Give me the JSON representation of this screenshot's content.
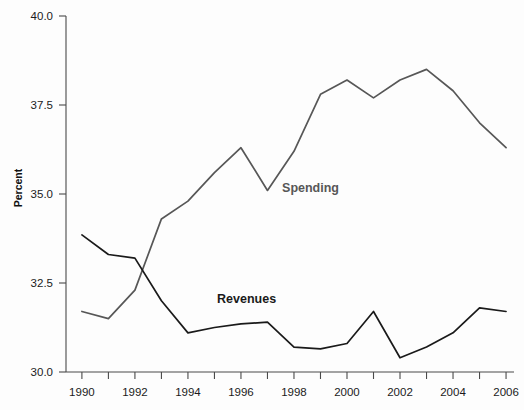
{
  "chart_data": {
    "type": "line",
    "title": "",
    "subtitle": "",
    "xlabel": "",
    "ylabel": "Percent",
    "x": [
      1990,
      1991,
      1992,
      1993,
      1994,
      1995,
      1996,
      1997,
      1998,
      1999,
      2000,
      2001,
      2002,
      2003,
      2004,
      2005,
      2006
    ],
    "xlim": [
      1989.4,
      2006.3
    ],
    "ylim": [
      30.0,
      40.0
    ],
    "y_ticks": [
      30.0,
      32.5,
      35.0,
      37.5,
      40.0
    ],
    "y_tick_labels": [
      "30.0",
      "32.5",
      "35.0",
      "37.5",
      "40.0"
    ],
    "x_ticks": [
      1990,
      1991,
      1992,
      1993,
      1994,
      1995,
      1996,
      1997,
      1998,
      1999,
      2000,
      2001,
      2002,
      2003,
      2004,
      2005,
      2006
    ],
    "x_tick_labels": [
      "1990",
      "",
      "1992",
      "",
      "1994",
      "",
      "1996",
      "",
      "1998",
      "",
      "2000",
      "",
      "2002",
      "",
      "2004",
      "",
      "2006"
    ],
    "x_major_labels": [
      "1990",
      "1992",
      "1994",
      "1996",
      "1998",
      "2000",
      "2002",
      "2004",
      "2006"
    ],
    "grid": false,
    "legend": "inline-labels",
    "series": [
      {
        "name": "Spending",
        "color": "#575757",
        "label_x": 1997.55,
        "label_y": 35.07,
        "values": [
          31.7,
          31.5,
          32.3,
          34.3,
          34.8,
          35.6,
          36.3,
          35.1,
          36.2,
          37.8,
          38.2,
          37.7,
          38.2,
          38.5,
          37.9,
          37.0,
          36.3
        ]
      },
      {
        "name": "Revenues",
        "color": "#1a1a1a",
        "label_x": 1995.1,
        "label_y": 31.95,
        "values": [
          33.85,
          33.3,
          33.2,
          32.0,
          31.1,
          31.25,
          31.35,
          31.4,
          30.7,
          30.65,
          30.8,
          31.7,
          30.4,
          30.7,
          31.1,
          31.8,
          31.7
        ]
      }
    ]
  },
  "axes": {
    "y_axis_title": "Percent"
  }
}
